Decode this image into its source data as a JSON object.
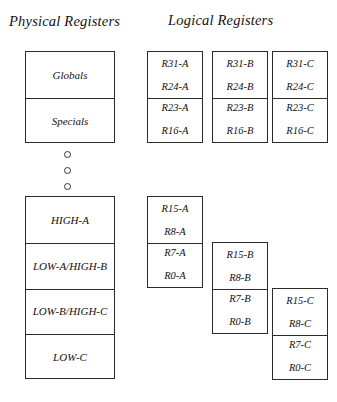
{
  "headings": {
    "physical": "Physical Registers",
    "logical": "Logical Registers"
  },
  "physical": {
    "top_box": {
      "sections": [
        {
          "label": "Globals"
        },
        {
          "label": "Specials"
        }
      ]
    },
    "ellipsis": {
      "dots": 3
    },
    "bottom_box": {
      "sections": [
        {
          "label": "HIGH-A"
        },
        {
          "label": "LOW-A/HIGH-B"
        },
        {
          "label": "LOW-B/HIGH-C"
        },
        {
          "label": "LOW-C"
        }
      ]
    }
  },
  "logical": {
    "columns": [
      {
        "name": "A",
        "top_box": {
          "upper": {
            "top": "R31-A",
            "bottom": "R24-A"
          },
          "lower": {
            "top": "R23-A",
            "bottom": "R16-A"
          }
        },
        "bottom_box": {
          "upper": {
            "top": "R15-A",
            "bottom": "R8-A"
          },
          "lower": {
            "top": "R7-A",
            "bottom": "R0-A"
          }
        }
      },
      {
        "name": "B",
        "top_box": {
          "upper": {
            "top": "R31-B",
            "bottom": "R24-B"
          },
          "lower": {
            "top": "R23-B",
            "bottom": "R16-B"
          }
        },
        "bottom_box": {
          "upper": {
            "top": "R15-B",
            "bottom": "R8-B"
          },
          "lower": {
            "top": "R7-B",
            "bottom": "R0-B"
          }
        }
      },
      {
        "name": "C",
        "top_box": {
          "upper": {
            "top": "R31-C",
            "bottom": "R24-C"
          },
          "lower": {
            "top": "R23-C",
            "bottom": "R16-C"
          }
        },
        "bottom_box": {
          "upper": {
            "top": "R15-C",
            "bottom": "R8-C"
          },
          "lower": {
            "top": "R7-C",
            "bottom": "R0-C"
          }
        }
      }
    ]
  }
}
